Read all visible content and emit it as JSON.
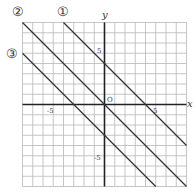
{
  "chart_data": {
    "type": "line",
    "title": "",
    "xlabel": "x",
    "ylabel": "y",
    "xlim": [
      -8,
      8
    ],
    "ylim": [
      -8,
      8
    ],
    "grid": true,
    "origin_label": "O",
    "x_ticks": [
      {
        "value": -5,
        "label": "-5"
      },
      {
        "value": 5,
        "label": "5"
      }
    ],
    "y_ticks": [
      {
        "value": 5,
        "label": "5"
      },
      {
        "value": -5,
        "label": "-5"
      }
    ],
    "series": [
      {
        "name": "①",
        "equation": "y = -x + 4",
        "slope": -1,
        "intercept": 4
      },
      {
        "name": "②",
        "equation": "y = -x",
        "slope": -1,
        "intercept": 0
      },
      {
        "name": "③",
        "equation": "y = -x - 3",
        "slope": -1,
        "intercept": -3
      }
    ]
  },
  "labels": {
    "line1": "①",
    "line2": "②",
    "line3": "③",
    "x_axis": "x",
    "y_axis": "y",
    "origin": "O",
    "x_neg5": "-5",
    "x_pos5": "5",
    "y_pos5": "5",
    "y_neg5": "-5"
  }
}
